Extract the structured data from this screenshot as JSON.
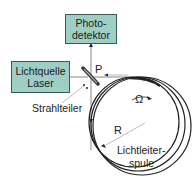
{
  "photodetector": {
    "line1": "Photo-",
    "line2": "detektor"
  },
  "laser": {
    "line1": "Lichtquelle",
    "line2": "Laser"
  },
  "labels": {
    "beam_splitter": "Strahlteiler",
    "power": "P",
    "rotation": "Ω",
    "radius": "R",
    "coil_line1": "Lichtleiter-",
    "coil_line2": "spule"
  },
  "colors": {
    "box_fill": "#9fcfc4",
    "box_border": "#3c5a55",
    "line": "#222222",
    "thin_line": "#999999"
  }
}
